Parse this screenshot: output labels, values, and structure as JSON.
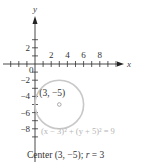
{
  "diagram": {
    "type": "coordinate-plane-circle",
    "axes": {
      "x_label": "x",
      "y_label": "y",
      "origin_label": "0",
      "x_range": [
        -3,
        11
      ],
      "y_range": [
        -10,
        6
      ],
      "x_ticks": [
        -3,
        -2,
        -1,
        1,
        2,
        3,
        4,
        5,
        6,
        7,
        8,
        9,
        10
      ],
      "x_tick_labels": [
        {
          "value": 2,
          "text": "2"
        },
        {
          "value": 4,
          "text": "4"
        },
        {
          "value": 6,
          "text": "6"
        },
        {
          "value": 8,
          "text": "8"
        }
      ],
      "y_ticks": [
        3,
        2,
        1,
        -1,
        -2,
        -3,
        -4,
        -5,
        -6,
        -7,
        -8,
        -9
      ],
      "y_tick_labels": [
        {
          "value": 2,
          "text": "2"
        },
        {
          "value": -2,
          "text": "−2"
        },
        {
          "value": -4,
          "text": "−4"
        },
        {
          "value": -6,
          "text": "−6"
        },
        {
          "value": -8,
          "text": "−8"
        }
      ]
    },
    "circle": {
      "center": [
        3,
        -5
      ],
      "radius": 3,
      "color": "#c8c8c8",
      "center_label": "(3, −5)",
      "equation": "(x − 3)² + (y + 5)² = 9"
    },
    "caption": {
      "prefix": "Center (3, −5); ",
      "r_symbol": "r",
      "suffix": " = 3"
    }
  }
}
